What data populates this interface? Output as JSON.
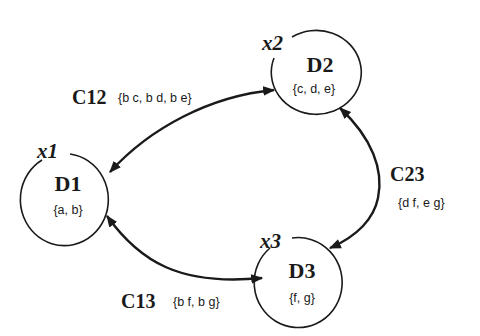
{
  "diagram": {
    "type": "constraint-network",
    "colors": {
      "stroke": "#1a1a1a",
      "background": "#ffffff"
    },
    "nodes": [
      {
        "id": "x1",
        "variable": "x1",
        "domain_label": "D1",
        "values": "{a, b}"
      },
      {
        "id": "x2",
        "variable": "x2",
        "domain_label": "D2",
        "values": "{c, d, e}"
      },
      {
        "id": "x3",
        "variable": "x3",
        "domain_label": "D3",
        "values": "{f, g}"
      }
    ],
    "edges": [
      {
        "id": "C12",
        "label": "C12",
        "tuples": "{b c, b d, b e}",
        "from": "x1",
        "to": "x2",
        "arrows": "both"
      },
      {
        "id": "C23",
        "label": "C23",
        "tuples": "{d f, e g}",
        "from": "x2",
        "to": "x3",
        "arrows": "both"
      },
      {
        "id": "C13",
        "label": "C13",
        "tuples": "{b f, b g}",
        "from": "x1",
        "to": "x3",
        "arrows": "both"
      }
    ]
  }
}
